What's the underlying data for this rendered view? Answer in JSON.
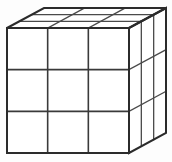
{
  "figure": {
    "kind": "geometric-solid",
    "caption": "",
    "background_color": "#fdfdfd",
    "line_color": "#2b2b2b",
    "inner_line_color": "#3a3a3a",
    "face_fill_color": "#ffffff",
    "divisions_per_edge": 3,
    "total_unit_cubes": 27,
    "visible_faces": [
      "front",
      "top",
      "right"
    ],
    "projection": "oblique",
    "geometry": {
      "front_top_left": [
        7,
        28
      ],
      "front_top_right": [
        129,
        28
      ],
      "front_bottom_left": [
        7,
        153
      ],
      "front_bottom_right": [
        129,
        153
      ],
      "depth_vector": [
        37,
        -20
      ],
      "back_top_left": [
        44,
        8
      ],
      "back_top_right": [
        166,
        8
      ],
      "back_bottom_right": [
        166,
        133
      ],
      "front_width": 122,
      "front_height": 125,
      "column_step": 40.67,
      "row_step": 41.67
    },
    "front_face_grid": {
      "rows": 3,
      "cols": 3,
      "cells": [
        [
          "front-r1c1",
          "front-r1c2",
          "front-r1c3"
        ],
        [
          "front-r2c1",
          "front-r2c2",
          "front-r2c3"
        ],
        [
          "front-r3c1",
          "front-r3c2",
          "front-r3c3"
        ]
      ]
    },
    "top_face_grid": {
      "rows": 3,
      "cols": 3,
      "cells": [
        [
          "top-r1c1",
          "top-r1c2",
          "top-r1c3"
        ],
        [
          "top-r2c1",
          "top-r2c2",
          "top-r2c3"
        ],
        [
          "top-r3c1",
          "top-r3c2",
          "top-r3c3"
        ]
      ]
    },
    "right_face_grid": {
      "rows": 3,
      "cols": 3,
      "cells": [
        [
          "right-r1c1",
          "right-r1c2",
          "right-r1c3"
        ],
        [
          "right-r2c1",
          "right-r2c2",
          "right-r2c3"
        ],
        [
          "right-r3c1",
          "right-r3c2",
          "right-r3c3"
        ]
      ]
    }
  }
}
